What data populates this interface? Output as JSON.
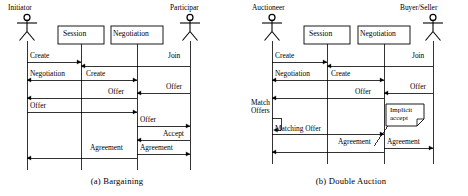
{
  "figure_a": {
    "caption": "(a)  Bargaining",
    "actors": [
      {
        "name": "Initiator",
        "label_x": 8,
        "label_y": 5,
        "lifeline_x": 27
      },
      {
        "name": "Participar",
        "label_x": 172,
        "label_y": 5,
        "lifeline_x": 190
      }
    ],
    "objects": [
      {
        "name": "Session",
        "x": 58,
        "y": 26,
        "w": 46,
        "h": 18,
        "lifeline_x": 81
      },
      {
        "name": "Negotiation",
        "x": 111,
        "y": 26,
        "w": 52,
        "h": 18,
        "lifeline_x": 137
      }
    ],
    "messages": [
      {
        "label": "Create",
        "from": 27,
        "to": 81,
        "y": 62,
        "label_x": 30,
        "label_y": 55,
        "dir": "right"
      },
      {
        "label": "Join",
        "from": 190,
        "to": 81,
        "y": 66,
        "label_x": 166,
        "label_y": 55,
        "dir": "left"
      },
      {
        "label": "Negotiation",
        "from": 81,
        "to": 27,
        "y": 80,
        "label_x": 30,
        "label_y": 72,
        "dir": "left"
      },
      {
        "label": "Create",
        "from": 81,
        "to": 137,
        "y": 80,
        "label_x": 86,
        "label_y": 72,
        "dir": "right"
      },
      {
        "label": "Offer",
        "from": 190,
        "to": 137,
        "y": 93,
        "label_x": 166,
        "label_y": 84,
        "dir": "left"
      },
      {
        "label": "Offer",
        "from": 137,
        "to": 27,
        "y": 98,
        "label_x": 106,
        "label_y": 89,
        "dir": "left"
      },
      {
        "label": "Offer",
        "from": 27,
        "to": 137,
        "y": 112,
        "label_x": 30,
        "label_y": 103,
        "dir": "right"
      },
      {
        "label": "Offer",
        "from": 137,
        "to": 190,
        "y": 126,
        "label_x": 140,
        "label_y": 117,
        "dir": "right"
      },
      {
        "label": "Accept",
        "from": 190,
        "to": 137,
        "y": 140,
        "label_x": 163,
        "label_y": 131,
        "dir": "left"
      },
      {
        "label": "Agreement",
        "from": 137,
        "to": 190,
        "y": 154,
        "label_x": 140,
        "label_y": 145,
        "dir": "right"
      },
      {
        "label": "Agreement",
        "from": 137,
        "to": 27,
        "y": 158,
        "label_x": 90,
        "label_y": 146,
        "dir": "left"
      }
    ],
    "lifeline_bottom": 170
  },
  "figure_b": {
    "caption": "(b)  Double Auction",
    "actors": [
      {
        "name": "Auctioneer",
        "label_x": 20,
        "label_y": 5,
        "lifeline_x": 38
      },
      {
        "name": "Buyer/Seller",
        "label_x": 170,
        "label_y": 5,
        "lifeline_x": 199
      }
    ],
    "objects": [
      {
        "name": "Session",
        "x": 70,
        "y": 26,
        "w": 46,
        "h": 18,
        "lifeline_x": 93
      },
      {
        "name": "Negotiation",
        "x": 124,
        "y": 26,
        "w": 52,
        "h": 18,
        "lifeline_x": 150
      }
    ],
    "messages": [
      {
        "label": "Create",
        "from": 38,
        "to": 93,
        "y": 62,
        "label_x": 41,
        "label_y": 55,
        "dir": "right"
      },
      {
        "label": "Join",
        "from": 199,
        "to": 93,
        "y": 66,
        "label_x": 176,
        "label_y": 55,
        "dir": "left"
      },
      {
        "label": "Negotiation",
        "from": 93,
        "to": 38,
        "y": 80,
        "label_x": 41,
        "label_y": 72,
        "dir": "left"
      },
      {
        "label": "Create",
        "from": 93,
        "to": 150,
        "y": 80,
        "label_x": 97,
        "label_y": 72,
        "dir": "right"
      },
      {
        "label": "Offer",
        "from": 199,
        "to": 150,
        "y": 93,
        "label_x": 176,
        "label_y": 84,
        "dir": "left"
      },
      {
        "label": "Offer",
        "from": 150,
        "to": 38,
        "y": 98,
        "label_x": 119,
        "label_y": 89,
        "dir": "left"
      },
      {
        "label": "Matching Offer",
        "from": 38,
        "to": 150,
        "y": 134,
        "label_x": 41,
        "label_y": 126,
        "dir": "right"
      },
      {
        "label": "Agreement",
        "from": 150,
        "to": 199,
        "y": 148,
        "label_x": 153,
        "label_y": 139,
        "dir": "right"
      },
      {
        "label": "Agreement",
        "from": 150,
        "to": 38,
        "y": 152,
        "label_x": 104,
        "label_y": 141,
        "dir": "left"
      }
    ],
    "self_action": {
      "label_line1": "Match",
      "label_line2": "Offers",
      "label_x": 18,
      "label_y": 102,
      "lifeline_x": 38,
      "top": 118,
      "bottom": 130,
      "width": 9
    },
    "note": {
      "line1": "Implicit",
      "line2": "accept",
      "x": 152,
      "y": 104,
      "w": 38,
      "h": 22,
      "fold": 7,
      "leader_to_x": 140,
      "leader_to_y": 146
    },
    "lifeline_bottom": 164
  },
  "colors": {
    "stroke": "#000000",
    "background": "#ffffff",
    "box_fill": "#ffffff"
  }
}
